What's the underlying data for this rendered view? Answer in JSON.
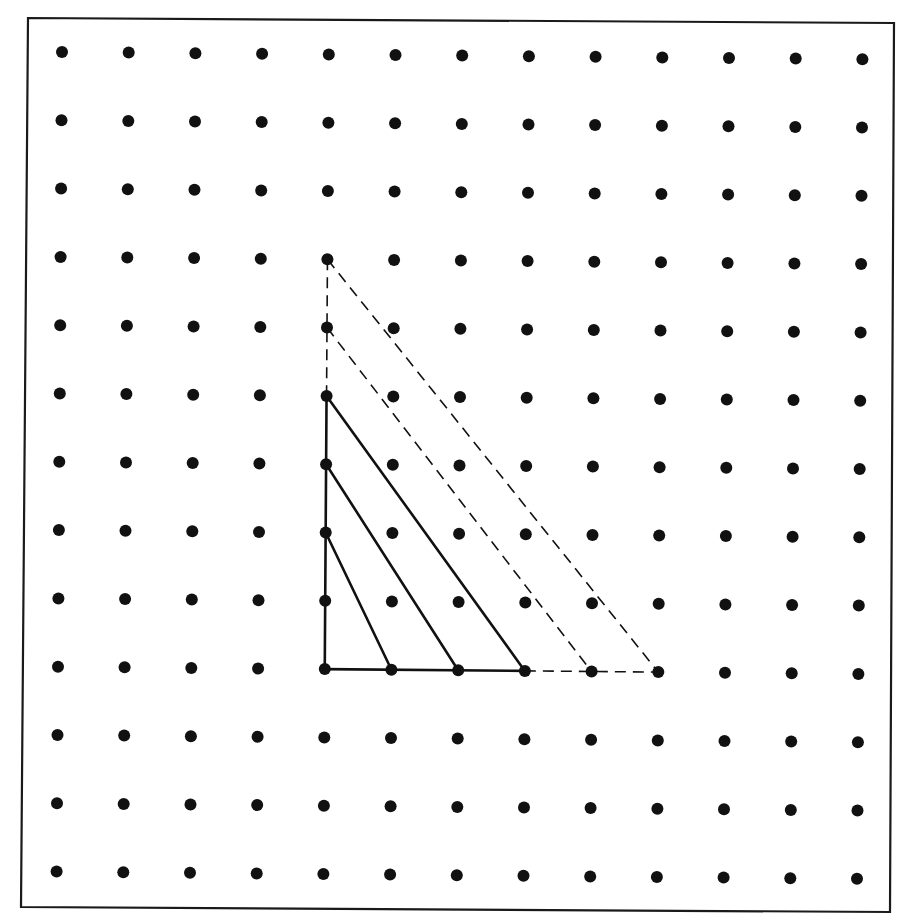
{
  "diagram": {
    "type": "geoboard-dot-grid",
    "background": "#ffffff",
    "ink_color": "#111111",
    "frame": {
      "corners": [
        [
          28,
          18
        ],
        [
          894,
          23
        ],
        [
          890,
          912
        ],
        [
          21,
          907
        ]
      ]
    },
    "grid": {
      "rows": 13,
      "cols": 13,
      "origin": [
        62,
        52
      ],
      "col_step": [
        66.7,
        0.6
      ],
      "row_step": [
        -0.45,
        68.3
      ],
      "dot_radius": 6
    },
    "triangles": {
      "description": "Nested right triangles sharing the right-angle vertex at grid point (col 4, row 9); hypotenuse slope 2 rows up per 1 column right... scaled similar triangles",
      "right_angle_vertex": {
        "col": 4,
        "row": 9
      },
      "vertical_leg": [
        {
          "from": {
            "col": 4,
            "row": 5
          },
          "to": {
            "col": 4,
            "row": 9
          },
          "style": "solid"
        },
        {
          "from": {
            "col": 4,
            "row": 3
          },
          "to": {
            "col": 4,
            "row": 5
          },
          "style": "dashed"
        }
      ],
      "horizontal_leg": [
        {
          "from": {
            "col": 4,
            "row": 9
          },
          "to": {
            "col": 7,
            "row": 9
          },
          "style": "solid"
        },
        {
          "from": {
            "col": 7,
            "row": 9
          },
          "to": {
            "col": 9,
            "row": 9
          },
          "style": "dashed"
        }
      ],
      "hypotenuses": [
        {
          "from": {
            "col": 4,
            "row": 7
          },
          "to": {
            "col": 5,
            "row": 9
          },
          "style": "solid"
        },
        {
          "from": {
            "col": 4,
            "row": 6
          },
          "to": {
            "col": 6,
            "row": 9
          },
          "style": "solid"
        },
        {
          "from": {
            "col": 4,
            "row": 5
          },
          "to": {
            "col": 7,
            "row": 9
          },
          "style": "solid"
        },
        {
          "from": {
            "col": 4,
            "row": 4
          },
          "to": {
            "col": 8,
            "row": 9
          },
          "style": "dashed"
        },
        {
          "from": {
            "col": 4,
            "row": 3
          },
          "to": {
            "col": 9,
            "row": 9
          },
          "style": "dashed"
        }
      ]
    }
  }
}
